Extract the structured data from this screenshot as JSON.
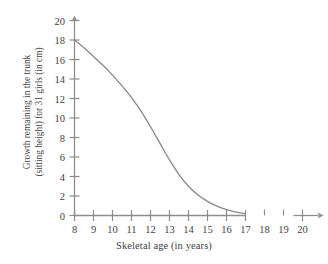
{
  "chart_data": {
    "type": "line",
    "title": "",
    "subtitle": "",
    "xlabel": "Skeletal age (in years)",
    "ylabel_line1": "Growth remaining in the trunk",
    "ylabel_line2": "(sitting height) for 31 girls (in cm)",
    "ylabel": "Growth remaining in the trunk (sitting height) for 31 girls (in cm)",
    "xlim": [
      8,
      20
    ],
    "ylim": [
      0,
      20
    ],
    "xticks": [
      8,
      9,
      10,
      11,
      12,
      13,
      14,
      15,
      16,
      17,
      18,
      19,
      20
    ],
    "xtick_labels": [
      "8",
      "9",
      "10",
      "11",
      "12",
      "13",
      "14",
      "15",
      "16",
      "17",
      "18",
      "19",
      "20"
    ],
    "yticks": [
      0,
      2,
      4,
      6,
      8,
      10,
      12,
      14,
      16,
      18,
      20
    ],
    "ytick_labels": [
      "0",
      "2",
      "4",
      "6",
      "8",
      "10",
      "12",
      "14",
      "16",
      "18",
      "20"
    ],
    "grid": false,
    "legend": null,
    "axis_arrows": {
      "x": "right",
      "y": "up"
    },
    "data_axis_extent_x": [
      8,
      17
    ],
    "series": [
      {
        "name": "Growth remaining",
        "color": "#8a8a8a",
        "x": [
          8,
          8.5,
          9,
          9.5,
          10,
          10.5,
          11,
          11.5,
          12,
          12.5,
          13,
          13.5,
          14,
          14.5,
          15,
          15.5,
          16,
          16.5,
          17
        ],
        "values": [
          18.0,
          17.2,
          16.3,
          15.4,
          14.4,
          13.3,
          12.1,
          10.7,
          9.1,
          7.4,
          5.7,
          4.2,
          3.0,
          2.1,
          1.45,
          0.95,
          0.6,
          0.35,
          0.2
        ]
      }
    ],
    "annotations": []
  },
  "colors": {
    "curve": "#8a8a8a",
    "axis": "#8d8d8d",
    "text": "#3f3f3f",
    "background": "#ffffff"
  }
}
